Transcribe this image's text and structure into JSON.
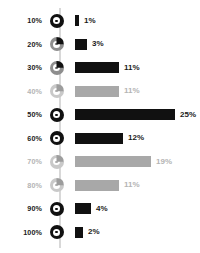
{
  "chart_data": {
    "type": "bar",
    "title": "",
    "xlabel": "",
    "ylabel": "",
    "orientation": "horizontal",
    "grid": false,
    "legend": false,
    "axis_tick_labels": [
      "10%",
      "20%",
      "30%",
      "40%",
      "50%",
      "60%",
      "70%",
      "80%",
      "90%",
      "100%"
    ],
    "categories": [
      "10%",
      "20%",
      "30%",
      "40%",
      "50%",
      "60%",
      "70%",
      "80%",
      "90%",
      "100%"
    ],
    "values": [
      1,
      3,
      11,
      11,
      25,
      12,
      19,
      11,
      4,
      2
    ],
    "value_labels": [
      "1%",
      "3%",
      "11%",
      "11%",
      "25%",
      "12%",
      "19%",
      "11%",
      "4%",
      "2%"
    ],
    "xlim": [
      0,
      25
    ],
    "rows": [
      {
        "axis_label": "10%",
        "value": 1,
        "value_label": "1%",
        "style": "dark",
        "marker": "full"
      },
      {
        "axis_label": "20%",
        "value": 3,
        "value_label": "3%",
        "style": "dark",
        "marker": "partial"
      },
      {
        "axis_label": "30%",
        "value": 11,
        "value_label": "11%",
        "style": "dark",
        "marker": "partial"
      },
      {
        "axis_label": "40%",
        "value": 11,
        "value_label": "11%",
        "style": "muted",
        "marker": "partial"
      },
      {
        "axis_label": "50%",
        "value": 25,
        "value_label": "25%",
        "style": "dark",
        "marker": "full"
      },
      {
        "axis_label": "60%",
        "value": 12,
        "value_label": "12%",
        "style": "dark",
        "marker": "full"
      },
      {
        "axis_label": "70%",
        "value": 19,
        "value_label": "19%",
        "style": "muted",
        "marker": "partial"
      },
      {
        "axis_label": "80%",
        "value": 11,
        "value_label": "11%",
        "style": "muted",
        "marker": "partial"
      },
      {
        "axis_label": "90%",
        "value": 4,
        "value_label": "4%",
        "style": "dark",
        "marker": "full"
      },
      {
        "axis_label": "100%",
        "value": 2,
        "value_label": "2%",
        "style": "dark",
        "marker": "full"
      }
    ],
    "colors": {
      "dark": "#111111",
      "muted": "#a8a8a8",
      "muted_text": "#b4b4b4",
      "spine": "#d8d8d8",
      "background": "#ffffff"
    }
  }
}
